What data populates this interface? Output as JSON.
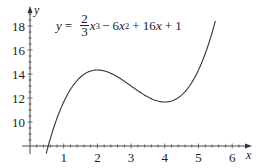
{
  "chart_data": {
    "type": "line",
    "title": "",
    "equation": {
      "lhs": "y",
      "eq": "=",
      "frac_num": "2",
      "frac_den": "3",
      "term1_var": "x",
      "term1_exp": "3",
      "term2": "− 6",
      "term2_var": "x",
      "term2_exp": "2",
      "term3": "+ 16",
      "term3_var": "x",
      "term4": "+ 1",
      "text": "y = (2/3)x^3 − 6x^2 + 16x + 1"
    },
    "function": {
      "a3": 0.6666667,
      "a2": -6,
      "a1": 16,
      "a0": 1
    },
    "xlabel": "x",
    "ylabel": "y",
    "xlim": [
      0,
      6.5
    ],
    "ylim": [
      8,
      19
    ],
    "x_ticks": [
      1,
      2,
      3,
      4,
      5,
      6
    ],
    "x_tick_labels": [
      "1",
      "2",
      "3",
      "4",
      "5",
      "6"
    ],
    "y_ticks": [
      10,
      12,
      14,
      16,
      18
    ],
    "y_tick_labels": [
      "10",
      "12",
      "14",
      "16",
      "18"
    ],
    "curve_domain": [
      0.48,
      5.5
    ],
    "grid": false,
    "legend": null,
    "series": [
      {
        "name": "y = (2/3)x^3 − 6x^2 + 16x + 1",
        "x": [
          0.5,
          1,
          1.5,
          2,
          2.5,
          3,
          3.5,
          4,
          4.5,
          5,
          5.5
        ],
        "y": [
          7.58,
          11.67,
          13.75,
          14.33,
          13.92,
          13.0,
          12.08,
          11.67,
          12.25,
          14.33,
          18.42
        ]
      }
    ],
    "annotations": [
      {
        "type": "local-max",
        "x": 2,
        "y": 14.33
      },
      {
        "type": "local-min",
        "x": 4,
        "y": 11.67
      }
    ],
    "colors": {
      "curve": "#333333",
      "axis": "#333333",
      "text": "#222222"
    }
  }
}
